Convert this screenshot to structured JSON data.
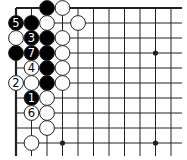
{
  "diagram": {
    "type": "go-board-fragment",
    "grid": {
      "cols_x": [
        16,
        31.5,
        47,
        62.5,
        78,
        93.5,
        109,
        124.5,
        140,
        155.5,
        171
      ],
      "rows_y": [
        8,
        23,
        38,
        53,
        68,
        83,
        98,
        113,
        128,
        143
      ],
      "line_end_x": 182,
      "line_end_y": 156,
      "edges": [
        "top",
        "left"
      ]
    },
    "star_points": [
      {
        "col": 9,
        "row": 3
      },
      {
        "col": 3,
        "row": 9
      },
      {
        "col": 9,
        "row": 9
      }
    ],
    "stones": [
      {
        "col": 2,
        "row": 0,
        "color": "black",
        "label": ""
      },
      {
        "col": 3,
        "row": 0,
        "color": "white",
        "label": ""
      },
      {
        "col": 0,
        "row": 1,
        "color": "black",
        "label": "5"
      },
      {
        "col": 1,
        "row": 1,
        "color": "black",
        "label": ""
      },
      {
        "col": 2,
        "row": 1,
        "color": "white",
        "label": ""
      },
      {
        "col": 4,
        "row": 1,
        "color": "white",
        "label": ""
      },
      {
        "col": 0,
        "row": 2,
        "color": "white",
        "label": ""
      },
      {
        "col": 1,
        "row": 2,
        "color": "black",
        "label": "3"
      },
      {
        "col": 2,
        "row": 2,
        "color": "black",
        "label": ""
      },
      {
        "col": 3,
        "row": 2,
        "color": "white",
        "label": ""
      },
      {
        "col": 0,
        "row": 3,
        "color": "black",
        "label": ""
      },
      {
        "col": 1,
        "row": 3,
        "color": "black",
        "label": "7"
      },
      {
        "col": 2,
        "row": 3,
        "color": "black",
        "label": ""
      },
      {
        "col": 3,
        "row": 3,
        "color": "white",
        "label": ""
      },
      {
        "col": 1,
        "row": 4,
        "color": "white",
        "label": "4"
      },
      {
        "col": 2,
        "row": 4,
        "color": "black",
        "label": ""
      },
      {
        "col": 3,
        "row": 4,
        "color": "white",
        "label": ""
      },
      {
        "col": 0,
        "row": 5,
        "color": "white",
        "label": "2"
      },
      {
        "col": 1,
        "row": 5,
        "color": "white",
        "label": ""
      },
      {
        "col": 2,
        "row": 5,
        "color": "black",
        "label": ""
      },
      {
        "col": 3,
        "row": 5,
        "color": "white",
        "label": ""
      },
      {
        "col": 1,
        "row": 6,
        "color": "black",
        "label": "1"
      },
      {
        "col": 2,
        "row": 6,
        "color": "white",
        "label": ""
      },
      {
        "col": 1,
        "row": 7,
        "color": "white",
        "label": "6"
      },
      {
        "col": 2,
        "row": 7,
        "color": "white",
        "label": ""
      },
      {
        "col": 2,
        "row": 8,
        "color": "white",
        "label": ""
      },
      {
        "col": 1,
        "row": 9,
        "color": "white",
        "label": ""
      }
    ],
    "colors": {
      "line": "#222222",
      "black_stone": "#000000",
      "white_stone": "#ffffff",
      "stone_outline": "#222222",
      "background": "#ffffff"
    }
  }
}
